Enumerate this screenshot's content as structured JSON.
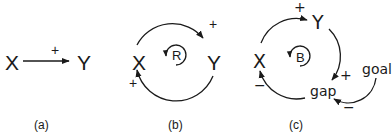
{
  "panels": [
    {
      "id": "a",
      "caption": "(a)",
      "nodes": {
        "x": "X",
        "y": "Y"
      },
      "links": [
        {
          "from": "X",
          "to": "Y",
          "polarity": "+"
        }
      ]
    },
    {
      "id": "b",
      "caption": "(b)",
      "nodes": {
        "x": "X",
        "y": "Y"
      },
      "loop_label": "R",
      "loop_type": "reinforcing",
      "links": [
        {
          "from": "X",
          "to": "Y",
          "polarity": "+"
        },
        {
          "from": "Y",
          "to": "X",
          "polarity": "+"
        }
      ]
    },
    {
      "id": "c",
      "caption": "(c)",
      "nodes": {
        "x": "X",
        "y": "Y",
        "gap": "gap",
        "goal": "goal"
      },
      "loop_label": "B",
      "loop_type": "balancing",
      "links": [
        {
          "from": "X",
          "to": "Y",
          "polarity": "+"
        },
        {
          "from": "Y",
          "to": "gap",
          "polarity": "+"
        },
        {
          "from": "gap",
          "to": "X",
          "polarity": "−"
        },
        {
          "from": "goal",
          "to": "gap",
          "polarity": "−"
        }
      ]
    }
  ]
}
